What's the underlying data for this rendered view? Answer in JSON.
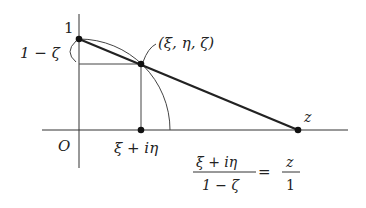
{
  "diagram": {
    "labels": {
      "top_point": "1",
      "height_label": "1 − ζ",
      "sphere_point": "(ξ, η, ζ)",
      "origin": "O",
      "projection_foot": "ξ + iη",
      "plane_point": "z"
    },
    "formula": {
      "lhs_numerator": "ξ + iη",
      "lhs_denominator": "1 − ζ",
      "equals": "=",
      "rhs_numerator": "z",
      "rhs_denominator": "1"
    },
    "colors": {
      "line": "#333333",
      "thick_line": "#222222",
      "point": "#111111"
    }
  }
}
